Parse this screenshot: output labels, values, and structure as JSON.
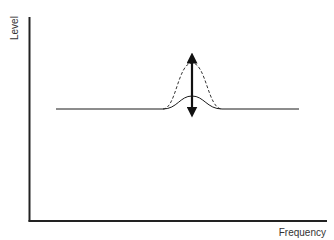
{
  "diagram": {
    "title": "",
    "axes": {
      "y_label": "Level",
      "x_label": "Frequency"
    },
    "curves": [
      {
        "name": "baseline-with-small-peak",
        "style": "solid",
        "description": "flat level with small bell-shaped bump"
      },
      {
        "name": "boosted-peak",
        "style": "dashed",
        "description": "larger bell-shaped bump at same center frequency"
      }
    ],
    "annotation": {
      "type": "double-headed-arrow",
      "meaning": "level adjustment (boost/cut) at center frequency"
    },
    "colors": {
      "line": "#1a1a1a",
      "axis": "#222222",
      "text": "#333333",
      "background": "#ffffff"
    }
  }
}
